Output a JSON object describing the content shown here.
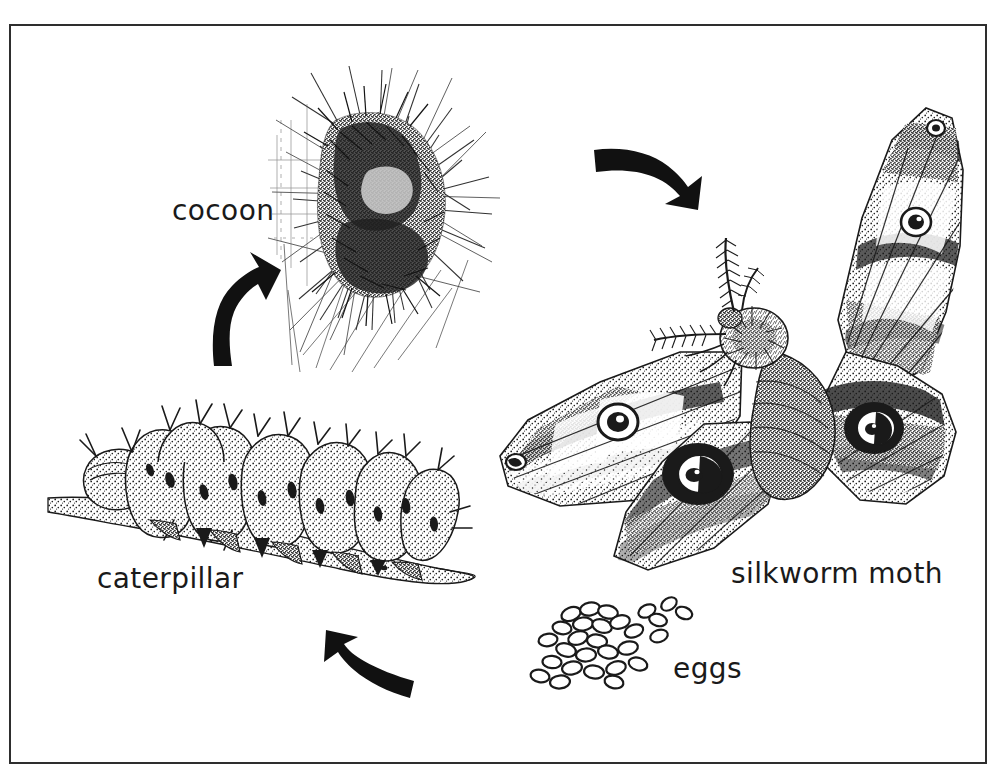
{
  "figure": {
    "kind": "scientific-illustration",
    "style": "black-and-white pen-and-ink line drawing",
    "background_color": "#ffffff",
    "ink_color": "#1a1a1a",
    "border_color": "#2e2e2e",
    "border": {
      "present": true,
      "x": 9,
      "y": 24,
      "width": 978,
      "height": 740,
      "stroke_width": 2
    }
  },
  "labels": {
    "cocoon": "cocoon",
    "caterpillar": "caterpillar",
    "silkworm_moth": "silkworm moth",
    "eggs": "eggs"
  },
  "stages": [
    {
      "name": "cocoon",
      "label": "cocoon",
      "label_x": 172,
      "label_y": 194,
      "drawing_center_x": 388,
      "drawing_center_y": 215
    },
    {
      "name": "silkworm-moth",
      "label": "silkworm moth",
      "label_x": 731,
      "label_y": 557,
      "drawing_center_x": 740,
      "drawing_center_y": 325
    },
    {
      "name": "eggs",
      "label": "eggs",
      "label_x": 673,
      "label_y": 652,
      "drawing_center_x": 605,
      "drawing_center_y": 640
    },
    {
      "name": "caterpillar",
      "label": "caterpillar",
      "label_x": 97,
      "label_y": 562,
      "drawing_center_x": 235,
      "drawing_center_y": 490
    }
  ],
  "arrows": [
    {
      "name": "arrow-caterpillar-to-cocoon",
      "from": "caterpillar",
      "to": "cocoon",
      "direction": "up-right",
      "x": 210,
      "y": 270,
      "width": 70,
      "height": 95
    },
    {
      "name": "arrow-cocoon-to-moth",
      "from": "cocoon",
      "to": "silkworm moth",
      "direction": "right-down",
      "x": 592,
      "y": 148,
      "width": 105,
      "height": 62
    },
    {
      "name": "arrow-eggs-to-caterpillar",
      "from": "eggs",
      "to": "caterpillar",
      "direction": "up-left",
      "x": 312,
      "y": 638,
      "width": 100,
      "height": 62
    }
  ]
}
